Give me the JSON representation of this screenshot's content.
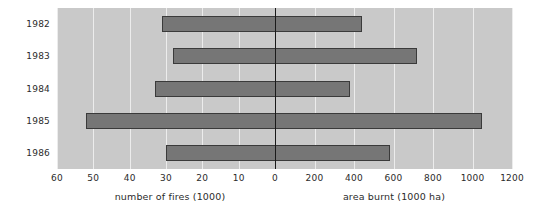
{
  "chart_data": {
    "type": "bar",
    "title": "",
    "subtitle": "",
    "orientation": "horizontal",
    "style": "bidirectional-pyramid",
    "categories": [
      "1982",
      "1983",
      "1984",
      "1985",
      "1986"
    ],
    "series": [
      {
        "name": "number of fires (1000)",
        "direction": "left",
        "values": [
          31,
          28,
          33,
          52,
          30
        ],
        "axis_label": "number of fires (1000)",
        "ticks": [
          60,
          50,
          40,
          30,
          20,
          10,
          0
        ],
        "lim": [
          60,
          0
        ]
      },
      {
        "name": "area burnt (1000 ha)",
        "direction": "right",
        "values": [
          440,
          720,
          380,
          1050,
          580
        ],
        "axis_label": "area burnt (1000 ha)",
        "ticks": [
          0,
          200,
          400,
          600,
          800,
          1000,
          1200
        ],
        "lim": [
          0,
          1200
        ]
      }
    ],
    "ylabel": "",
    "grid": true,
    "legend": "none",
    "colors": {
      "plot_background": "#c9c9c9",
      "gridline": "#ececec",
      "bar_fill": "#767676",
      "bar_stroke": "#3a3a3a",
      "zero_axis": "#1a1a1a",
      "text": "#2b2b2b",
      "page_background": "#ffffff"
    }
  },
  "axes": {
    "left": {
      "caption": "number of fires (1000)",
      "tick_labels": [
        "60",
        "50",
        "40",
        "30",
        "20",
        "10",
        "0"
      ]
    },
    "right": {
      "caption": "area burnt (1000 ha)",
      "tick_labels": [
        "0",
        "200",
        "400",
        "600",
        "800",
        "1000",
        "1200"
      ]
    }
  },
  "years": [
    "1982",
    "1983",
    "1984",
    "1985",
    "1986"
  ]
}
